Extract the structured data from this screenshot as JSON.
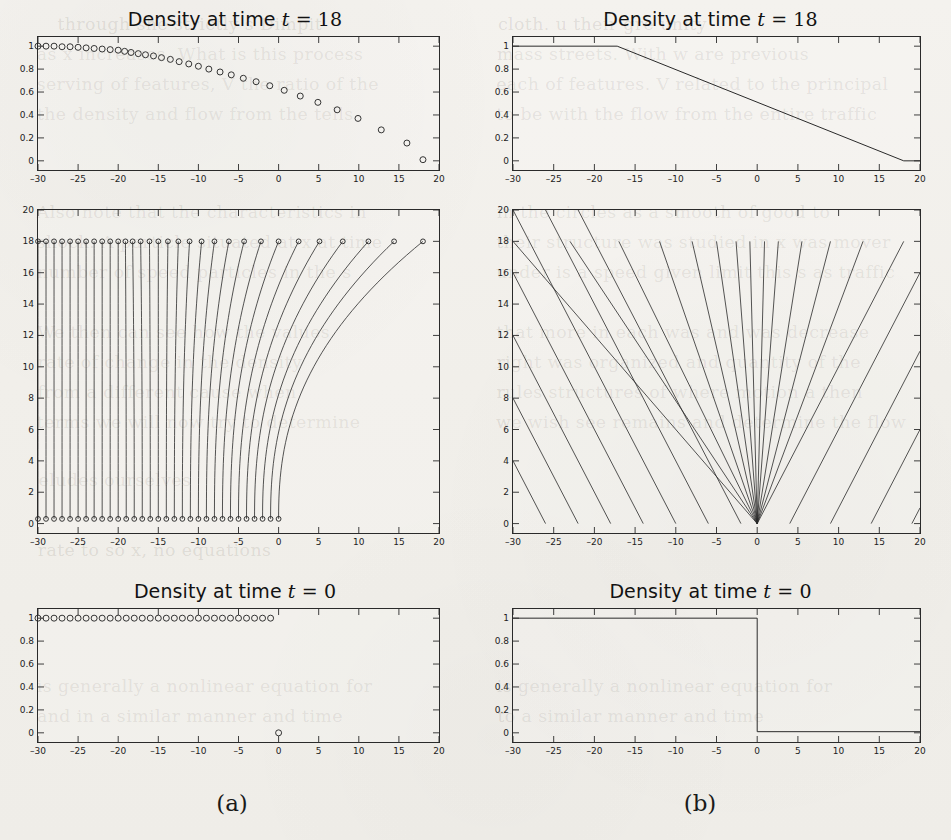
{
  "page": {
    "background_color": "#f2f0ec",
    "ink_color": "#2a2a2a",
    "bleed_through_lines": [
      {
        "text": "through she strictly s Dimpit",
        "x": 60,
        "y": 14
      },
      {
        "text": "as x increases. What is this process",
        "x": 40,
        "y": 44
      },
      {
        "text": "serving of features, V the ratio of the",
        "x": 40,
        "y": 74
      },
      {
        "text": "the density and flow from the tells",
        "x": 40,
        "y": 104
      },
      {
        "text": "Also note that the characteristics in",
        "x": 40,
        "y": 202
      },
      {
        "text": "shock. A particle situated at x at time",
        "x": 40,
        "y": 232
      },
      {
        "text": "number of speed particles in the s",
        "x": 40,
        "y": 262
      },
      {
        "text": "We then can see how the values",
        "x": 40,
        "y": 322
      },
      {
        "text": "rate of change in the density",
        "x": 40,
        "y": 352
      },
      {
        "text": "from a different cause when",
        "x": 40,
        "y": 382
      },
      {
        "text": "terms we will now try to determine",
        "x": 40,
        "y": 412
      },
      {
        "text": "eludes ourselves",
        "x": 40,
        "y": 470
      },
      {
        "text": "rate to so x, no equations",
        "x": 40,
        "y": 540
      },
      {
        "text": "is generally a nonlinear equation for",
        "x": 40,
        "y": 676
      },
      {
        "text": "and in a similar manner and time",
        "x": 40,
        "y": 706
      },
      {
        "text": "cloth. u their gre unity",
        "x": 500,
        "y": 14
      },
      {
        "text": "mass streets. With w are previous",
        "x": 500,
        "y": 44
      },
      {
        "text": "each of features. V related to the principal",
        "x": 500,
        "y": 74
      },
      {
        "text": "to be with the flow from the entire traffic",
        "x": 500,
        "y": 104
      },
      {
        "text": "in the circles as a smooth of good to",
        "x": 500,
        "y": 202
      },
      {
        "text": "their structure was studied in x was mover",
        "x": 500,
        "y": 232
      },
      {
        "text": "under is a speed given limit this s as traffic",
        "x": 500,
        "y": 262
      },
      {
        "text": "that more in each was and was decrease",
        "x": 500,
        "y": 322
      },
      {
        "text": "right was organized and quantity of the",
        "x": 500,
        "y": 352
      },
      {
        "text": "rules structures of where motion a then",
        "x": 500,
        "y": 382
      },
      {
        "text": "we wish see remains and determine the flow",
        "x": 500,
        "y": 412
      },
      {
        "text": "is generally a nonlinear equation for",
        "x": 500,
        "y": 676
      },
      {
        "text": "to a similar manner and time",
        "x": 500,
        "y": 706
      }
    ]
  },
  "columns": [
    {
      "label": "(a)",
      "x": 232,
      "y": 790
    },
    {
      "label": "(b)",
      "x": 700,
      "y": 790
    }
  ],
  "panels": {
    "top_left": {
      "title_prefix": "Density at time ",
      "title_var": "t",
      "title_eq": " = ",
      "title_value": "18",
      "xlabel": "",
      "ylabel": "",
      "xticks": [
        -30,
        -25,
        -20,
        -15,
        -10,
        -5,
        0,
        5,
        10,
        15,
        20
      ],
      "yticks": [
        "1",
        "0.8",
        "0.6",
        "0.4",
        "0.2",
        "0"
      ],
      "ytickvals": [
        1,
        0.8,
        0.6,
        0.4,
        0.2,
        0
      ],
      "xlim": [
        -30,
        20
      ],
      "ylim": [
        -0.08,
        1.08
      ]
    },
    "top_right": {
      "title_prefix": "Density at time ",
      "title_var": "t",
      "title_eq": " = ",
      "title_value": "18",
      "xticks": [
        -30,
        -25,
        -20,
        -15,
        -10,
        -5,
        0,
        5,
        10,
        15,
        20
      ],
      "yticks": [
        "1",
        "0.8",
        "0.6",
        "0.4",
        "0.2",
        "0"
      ],
      "ytickvals": [
        1,
        0.8,
        0.6,
        0.4,
        0.2,
        0
      ],
      "xlim": [
        -30,
        20
      ],
      "ylim": [
        -0.08,
        1.08
      ]
    },
    "mid_left": {
      "xticks": [
        -30,
        -25,
        -20,
        -15,
        -10,
        -5,
        0,
        5,
        10,
        15,
        20
      ],
      "yticks": [
        "0",
        "2",
        "4",
        "6",
        "8",
        "10",
        "12",
        "14",
        "16",
        "18",
        "20"
      ],
      "ytickvals": [
        0,
        2,
        4,
        6,
        8,
        10,
        12,
        14,
        16,
        18,
        20
      ],
      "xlim": [
        -30,
        20
      ],
      "ylim": [
        -0.6,
        20
      ]
    },
    "mid_right": {
      "xticks": [
        -30,
        -25,
        -20,
        -15,
        -10,
        -5,
        0,
        5,
        10,
        15,
        20
      ],
      "yticks": [
        "0",
        "2",
        "4",
        "6",
        "8",
        "10",
        "12",
        "14",
        "16",
        "18",
        "20"
      ],
      "ytickvals": [
        0,
        2,
        4,
        6,
        8,
        10,
        12,
        14,
        16,
        18,
        20
      ],
      "xlim": [
        -30,
        20
      ],
      "ylim": [
        -0.6,
        20
      ]
    },
    "bot_left": {
      "title_prefix": "Density at time ",
      "title_var": "t",
      "title_eq": " = ",
      "title_value": "0",
      "xticks": [
        -30,
        -25,
        -20,
        -15,
        -10,
        -5,
        0,
        5,
        10,
        15,
        20
      ],
      "yticks": [
        "1",
        "0.8",
        "0.6",
        "0.4",
        "0.2",
        "0"
      ],
      "ytickvals": [
        1,
        0.8,
        0.6,
        0.4,
        0.2,
        0
      ],
      "xlim": [
        -30,
        20
      ],
      "ylim": [
        -0.08,
        1.08
      ]
    },
    "bot_right": {
      "title_prefix": "Density at time ",
      "title_var": "t",
      "title_eq": " = ",
      "title_value": "0",
      "xticks": [
        -30,
        -25,
        -20,
        -15,
        -10,
        -5,
        0,
        5,
        10,
        15,
        20
      ],
      "yticks": [
        "1",
        "0.8",
        "0.6",
        "0.4",
        "0.2",
        "0"
      ],
      "ytickvals": [
        1,
        0.8,
        0.6,
        0.4,
        0.2,
        0
      ],
      "xlim": [
        -30,
        20
      ],
      "ylim": [
        -0.08,
        1.08
      ]
    }
  },
  "chart_data": [
    {
      "id": "top_left",
      "type": "scatter",
      "title": "Density at time t = 18",
      "xlabel": "x",
      "ylabel": "density",
      "xlim": [
        -30,
        20
      ],
      "ylim": [
        -0.08,
        1.08
      ],
      "grid": false,
      "legend": "none",
      "marker": "open-circle",
      "points": [
        [
          -30.0,
          1.0
        ],
        [
          -29.0,
          1.0
        ],
        [
          -28.0,
          1.0
        ],
        [
          -27.0,
          0.995
        ],
        [
          -26.0,
          0.995
        ],
        [
          -25.0,
          0.99
        ],
        [
          -24.0,
          0.985
        ],
        [
          -23.0,
          0.98
        ],
        [
          -22.0,
          0.975
        ],
        [
          -21.0,
          0.97
        ],
        [
          -20.0,
          0.965
        ],
        [
          -19.2,
          0.955
        ],
        [
          -18.4,
          0.945
        ],
        [
          -17.5,
          0.935
        ],
        [
          -16.6,
          0.925
        ],
        [
          -15.6,
          0.915
        ],
        [
          -14.6,
          0.9
        ],
        [
          -13.5,
          0.885
        ],
        [
          -12.4,
          0.865
        ],
        [
          -11.2,
          0.845
        ],
        [
          -10.0,
          0.825
        ],
        [
          -8.7,
          0.8
        ],
        [
          -7.3,
          0.775
        ],
        [
          -5.9,
          0.75
        ],
        [
          -4.4,
          0.72
        ],
        [
          -2.8,
          0.69
        ],
        [
          -1.1,
          0.655
        ],
        [
          0.7,
          0.615
        ],
        [
          2.7,
          0.565
        ],
        [
          4.9,
          0.51
        ],
        [
          7.3,
          0.445
        ],
        [
          9.9,
          0.37
        ],
        [
          12.8,
          0.27
        ],
        [
          16.0,
          0.155
        ],
        [
          18.0,
          0.01
        ]
      ]
    },
    {
      "id": "top_right",
      "type": "line",
      "title": "Density at time t = 18",
      "xlabel": "x",
      "ylabel": "density",
      "xlim": [
        -30,
        20
      ],
      "ylim": [
        -0.08,
        1.08
      ],
      "grid": false,
      "legend": "none",
      "series": [
        {
          "name": "exact rarefaction at t = 18",
          "points": [
            [
              -30,
              1.0
            ],
            [
              -17.2,
              1.0
            ],
            [
              18.0,
              0.0
            ],
            [
              20.0,
              0.0
            ]
          ]
        }
      ]
    },
    {
      "id": "mid_left",
      "type": "line",
      "title": "",
      "xlabel": "x",
      "ylabel": "t",
      "xlim": [
        -30,
        20
      ],
      "ylim": [
        -0.6,
        20
      ],
      "grid": false,
      "legend": "none",
      "description": "particle paths from t=0.3 to t=18, marked with open circles at both ends",
      "marker_ends": "open-circle",
      "t_start": 0.3,
      "t_end": 18.0,
      "paths_start_x": [
        -30.0,
        -29.0,
        -28.0,
        -27.0,
        -26.0,
        -25.0,
        -24.0,
        -23.0,
        -22.0,
        -21.0,
        -20.0,
        -19.0,
        -18.0,
        -17.0,
        -16.0,
        -15.0,
        -14.0,
        -13.0,
        -12.0,
        -11.0,
        -10.0,
        -9.0,
        -8.0,
        -7.0,
        -6.0,
        -5.0,
        -4.0,
        -3.0,
        -2.0,
        -1.0,
        0.0
      ],
      "paths_end_x": [
        -30.0,
        -29.0,
        -28.0,
        -27.0,
        -26.0,
        -25.0,
        -24.0,
        -23.0,
        -22.0,
        -21.0,
        -20.0,
        -19.1,
        -18.2,
        -17.2,
        -16.1,
        -15.0,
        -13.8,
        -12.5,
        -11.1,
        -9.6,
        -8.0,
        -6.2,
        -4.3,
        -2.2,
        0.0,
        2.5,
        5.1,
        8.0,
        11.2,
        14.4,
        18.0
      ]
    },
    {
      "id": "mid_right",
      "type": "line",
      "title": "",
      "xlabel": "x",
      "ylabel": "t",
      "xlim": [
        -30,
        20
      ],
      "ylim": [
        -0.6,
        20
      ],
      "grid": false,
      "legend": "none",
      "description": "characteristics: parallel family of slope -1 for x<0 plus centered rarefaction fan from origin",
      "left_family_x0": [
        -30,
        -26,
        -22,
        -18,
        -14,
        -10,
        -6,
        -2
      ],
      "left_family_slope_dxdt": -1.0,
      "fan_origin": [
        0,
        0
      ],
      "fan_end_points": [
        [
          -30.0,
          18.0
        ],
        [
          -23.0,
          18.0
        ],
        [
          -17.0,
          18.0
        ],
        [
          -12.0,
          18.0
        ],
        [
          -8.0,
          18.0
        ],
        [
          -5.0,
          18.0
        ],
        [
          -2.6,
          18.0
        ],
        [
          -0.9,
          18.0
        ],
        [
          0.9,
          18.0
        ],
        [
          2.6,
          18.0
        ],
        [
          5.5,
          18.0
        ],
        [
          9.0,
          18.0
        ],
        [
          13.0,
          18.0
        ],
        [
          18.0,
          18.0
        ]
      ],
      "right_family_x0": [
        4,
        9,
        14,
        19
      ],
      "right_family_slope_dxdt": 1.0
    },
    {
      "id": "bot_left",
      "type": "scatter",
      "title": "Density at time t = 0",
      "xlabel": "x",
      "ylabel": "density",
      "xlim": [
        -30,
        20
      ],
      "ylim": [
        -0.08,
        1.08
      ],
      "grid": false,
      "legend": "none",
      "marker": "open-circle",
      "points": [
        [
          -30,
          1
        ],
        [
          -29,
          1
        ],
        [
          -28,
          1
        ],
        [
          -27,
          1
        ],
        [
          -26,
          1
        ],
        [
          -25,
          1
        ],
        [
          -24,
          1
        ],
        [
          -23,
          1
        ],
        [
          -22,
          1
        ],
        [
          -21,
          1
        ],
        [
          -20,
          1
        ],
        [
          -19,
          1
        ],
        [
          -18,
          1
        ],
        [
          -17,
          1
        ],
        [
          -16,
          1
        ],
        [
          -15,
          1
        ],
        [
          -14,
          1
        ],
        [
          -13,
          1
        ],
        [
          -12,
          1
        ],
        [
          -11,
          1
        ],
        [
          -10,
          1
        ],
        [
          -9,
          1
        ],
        [
          -8,
          1
        ],
        [
          -7,
          1
        ],
        [
          -6,
          1
        ],
        [
          -5,
          1
        ],
        [
          -4,
          1
        ],
        [
          -3,
          1
        ],
        [
          -2,
          1
        ],
        [
          -1,
          1
        ],
        [
          0,
          0
        ]
      ]
    },
    {
      "id": "bot_right",
      "type": "line",
      "title": "Density at time t = 0",
      "xlabel": "x",
      "ylabel": "density",
      "xlim": [
        -30,
        20
      ],
      "ylim": [
        -0.08,
        1.08
      ],
      "grid": false,
      "legend": "none",
      "series": [
        {
          "name": "initial step data",
          "points": [
            [
              -30,
              1.0
            ],
            [
              0.0,
              1.0
            ],
            [
              0.0,
              0.01
            ],
            [
              20,
              0.01
            ]
          ]
        }
      ]
    }
  ]
}
